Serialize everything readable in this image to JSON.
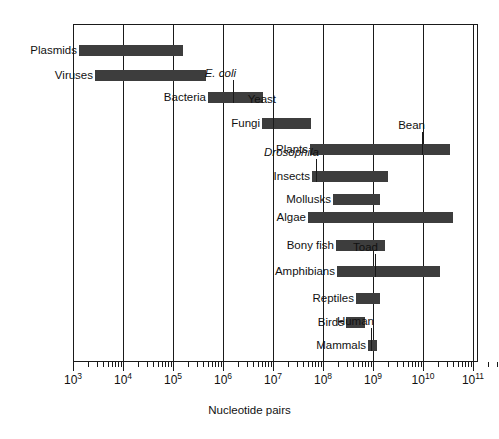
{
  "figure": {
    "x_axis_title": "Nucleotide pairs",
    "accent_bar_color": "#3d3d3d",
    "frame_color": "#1a1a1a"
  },
  "axis": {
    "tick_labels": [
      "10³",
      "10⁴",
      "10⁵",
      "10⁶",
      "10⁷",
      "10⁸",
      "10⁹",
      "10¹⁰",
      "10¹¹"
    ],
    "tick_bases": [
      "10",
      "10",
      "10",
      "10",
      "10",
      "10",
      "10",
      "10",
      "10"
    ],
    "tick_exponents": [
      "3",
      "4",
      "5",
      "6",
      "7",
      "8",
      "9",
      "10",
      "11"
    ],
    "scale": "log10",
    "min_exponent": 3,
    "max_exponent": 11.7
  },
  "chart_data": {
    "type": "bar",
    "title": "",
    "subtitle": "",
    "xlabel": "Nucleotide pairs",
    "ylabel": "",
    "xscale": "log10",
    "xlim": [
      1000,
      500000000000.0
    ],
    "xticks": [
      1000,
      10000,
      100000,
      1000000,
      10000000,
      100000000,
      1000000000,
      10000000000,
      100000000000
    ],
    "xticklabels": [
      "10³",
      "10⁴",
      "10⁵",
      "10⁶",
      "10⁷",
      "10⁸",
      "10⁹",
      "10¹⁰",
      "10¹¹"
    ],
    "grid": "vertical-major-only",
    "legend": "none",
    "orientation": "horizontal-range-bars",
    "categories": [
      {
        "label": "Plasmids",
        "min_exponent": 3.12,
        "max_exponent": 5.2,
        "range_text": "10^3.1 – 10^5.2",
        "markers": []
      },
      {
        "label": "Viruses",
        "min_exponent": 3.44,
        "max_exponent": 5.66,
        "range_text": "10^3.4 – 10^5.7",
        "markers": []
      },
      {
        "label": "Bacteria",
        "min_exponent": 5.7,
        "max_exponent": 6.8,
        "range_text": "10^5.7 – 10^6.8",
        "markers": [
          {
            "name": "E. coli",
            "exponent": 6.2,
            "italic": true,
            "position": "above"
          }
        ]
      },
      {
        "label": "Fungi",
        "min_exponent": 6.78,
        "max_exponent": 7.76,
        "range_text": "10^6.8 – 10^7.8",
        "markers": [
          {
            "name": "Yeast",
            "exponent": 7.0,
            "italic": false,
            "position": "above"
          }
        ]
      },
      {
        "label": "Plants",
        "min_exponent": 7.74,
        "max_exponent": 10.54,
        "range_text": "10^7.7 – 10^10.5",
        "markers": [
          {
            "name": "Bean",
            "exponent": 9.98,
            "italic": false,
            "position": "above"
          }
        ]
      },
      {
        "label": "Insects",
        "min_exponent": 7.78,
        "max_exponent": 9.3,
        "range_text": "10^7.8 – 10^9.3",
        "markers": [
          {
            "name": "Drosophila",
            "exponent": 7.86,
            "italic": true,
            "position": "above"
          }
        ]
      },
      {
        "label": "Mollusks",
        "min_exponent": 8.2,
        "max_exponent": 9.14,
        "range_text": "10^8.2 – 10^9.1",
        "markers": []
      },
      {
        "label": "Algae",
        "min_exponent": 7.7,
        "max_exponent": 10.6,
        "range_text": "10^7.7 – 10^10.6",
        "markers": []
      },
      {
        "label": "Bony fish",
        "min_exponent": 8.26,
        "max_exponent": 9.24,
        "range_text": "10^8.3 – 10^9.2",
        "markers": []
      },
      {
        "label": "Amphibians",
        "min_exponent": 8.28,
        "max_exponent": 10.34,
        "range_text": "10^8.3 – 10^10.3",
        "markers": [
          {
            "name": "Toad",
            "exponent": 9.04,
            "italic": false,
            "position": "above"
          }
        ]
      },
      {
        "label": "Reptiles",
        "min_exponent": 8.66,
        "max_exponent": 9.14,
        "range_text": "10^8.7 – 10^9.1",
        "markers": []
      },
      {
        "label": "Birds",
        "min_exponent": 8.46,
        "max_exponent": 8.84,
        "range_text": "10^8.5 – 10^8.8",
        "markers": []
      },
      {
        "label": "Mammals",
        "min_exponent": 8.9,
        "max_exponent": 9.08,
        "range_text": "10^8.9 – 10^9.1",
        "markers": [
          {
            "name": "Human",
            "exponent": 8.96,
            "italic": false,
            "position": "above"
          }
        ]
      }
    ]
  }
}
